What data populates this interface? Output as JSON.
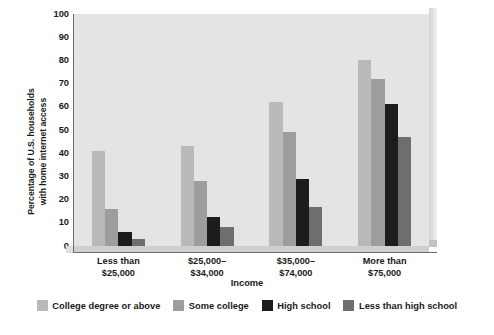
{
  "chart_data": {
    "type": "bar",
    "title": "",
    "subtitle": "",
    "xlabel": "Income",
    "ylabel": "Percentage of U.S. households with home internet access",
    "ylabel_lines": [
      "Percentage of U.S. households",
      "with home internet access"
    ],
    "categories": [
      "Less than $25,000",
      "$25,000–$34,000",
      "$35,000–$74,000",
      "More than $75,000"
    ],
    "category_lines": [
      [
        "Less than",
        "$25,000"
      ],
      [
        "$25,000–",
        "$34,000"
      ],
      [
        "$35,000–",
        "$74,000"
      ],
      [
        "More than",
        "$75,000"
      ]
    ],
    "series": [
      {
        "name": "College degree or above",
        "color": "#b9b9b9",
        "values": [
          41,
          43,
          62,
          80
        ]
      },
      {
        "name": "Some college",
        "color": "#9d9d9d",
        "values": [
          16,
          28,
          49,
          72
        ]
      },
      {
        "name": "High school",
        "color": "#1c1c1c",
        "values": [
          6,
          12.5,
          29,
          61
        ]
      },
      {
        "name": "Less than high school",
        "color": "#6e6e6e",
        "values": [
          3,
          8,
          17,
          47
        ]
      }
    ],
    "ylim": [
      0,
      100
    ],
    "ytick_labels": [
      "100",
      "90",
      "80",
      "70",
      "60",
      "50",
      "40",
      "30",
      "20",
      "10",
      "0"
    ],
    "ytick_values": [
      100,
      90,
      80,
      70,
      60,
      50,
      40,
      30,
      20,
      10,
      0
    ],
    "ytick_step": 10,
    "grid": false,
    "legend_position": "bottom",
    "plot_background": "#e4e4e4",
    "axis_color": "#6d6d6d"
  }
}
